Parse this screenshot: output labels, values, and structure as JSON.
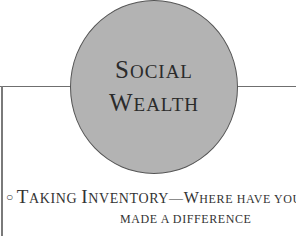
{
  "heading": {
    "line1_first": "S",
    "line1_rest": "OCIAL",
    "line2_first": "W",
    "line2_rest": "EALTH"
  },
  "bullet": {
    "marker": "○",
    "term_part1_first": "T",
    "term_part1_rest": "AKING ",
    "term_part2_first": "I",
    "term_part2_rest": "NVENTORY",
    "dash": "—",
    "question_first": "W",
    "question_rest": "HERE HAVE YOU",
    "question_line2": "MADE A DIFFERENCE"
  },
  "colors": {
    "circle_fill": "#b3b3b3",
    "rule": "#6f6f6f",
    "text": "#2b2b2b"
  }
}
